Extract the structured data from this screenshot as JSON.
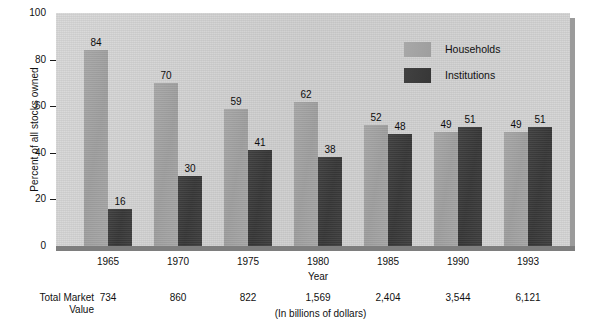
{
  "chart_data": {
    "type": "bar",
    "title": "",
    "xlabel": "Year",
    "ylabel": "Percent of all stocks owned",
    "ylim": [
      0,
      100
    ],
    "yticks": [
      0,
      20,
      40,
      60,
      80,
      100
    ],
    "ytick_labels": [
      "0",
      "20",
      "40",
      "60",
      "80",
      "100"
    ],
    "grid": false,
    "legend_position": "upper right (inside plot)",
    "categories": [
      "1965",
      "1970",
      "1975",
      "1980",
      "1985",
      "1990",
      "1993"
    ],
    "series": [
      {
        "name": "Households",
        "values": [
          84,
          70,
          59,
          62,
          52,
          49,
          49
        ],
        "color": "#a3a3a3"
      },
      {
        "name": "Institutions",
        "values": [
          16,
          30,
          41,
          38,
          48,
          51,
          51
        ],
        "color": "#3d3d3d"
      }
    ],
    "annotations": {
      "row_label": "Total Market Value",
      "row_label_line1": "Total Market",
      "row_label_line2": "Value",
      "row_values": [
        "734",
        "860",
        "822",
        "1,569",
        "2,404",
        "3,544",
        "6,121"
      ],
      "units_note": "(In billions of dollars)"
    }
  },
  "colors": {
    "plot_background": "#d2d2d2",
    "page_background": "#ffffff",
    "households_bar": "#a3a3a3",
    "institutions_bar": "#3d3d3d",
    "axis_text": "#111111",
    "baseline": "#7e7e7e",
    "plot_shadow": "#9b9b9b"
  }
}
